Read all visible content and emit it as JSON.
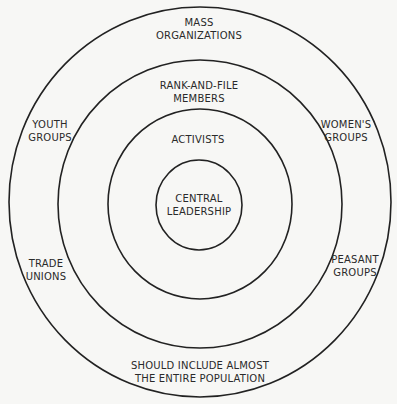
{
  "diagram": {
    "type": "concentric-circles",
    "colors": {
      "background": "#f7f7f5",
      "stroke": "#222222",
      "text": "#2a2a2a"
    },
    "rings": [
      {
        "name": "central-leadership",
        "lines": [
          "CENTRAL",
          "LEADERSHIP"
        ]
      },
      {
        "name": "activists",
        "lines": [
          "ACTIVISTS"
        ]
      },
      {
        "name": "rank-and-file",
        "lines": [
          "RANK-AND-FILE",
          "MEMBERS"
        ]
      },
      {
        "name": "mass-organizations",
        "lines": [
          "MASS",
          "ORGANIZATIONS"
        ]
      }
    ],
    "mass_groups": {
      "youth": [
        "YOUTH",
        "GROUPS"
      ],
      "womens": [
        "WOMEN'S",
        "GROUPS"
      ],
      "trade": [
        "TRADE",
        "UNIONS"
      ],
      "peasant": [
        "PEASANT",
        "GROUPS"
      ]
    },
    "footer": [
      "SHOULD INCLUDE ALMOST",
      "THE ENTIRE POPULATION"
    ]
  }
}
